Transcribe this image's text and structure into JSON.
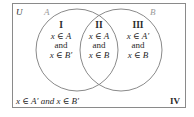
{
  "diagram": {
    "universe_label": "U",
    "set_a_label": "A",
    "set_b_label": "B",
    "colors": {
      "frame": "#8a8a8a",
      "circle": "#8a8a8a",
      "set_label": "#9a9a9a",
      "text": "#2a2a2a"
    },
    "regions": [
      {
        "numeral": "I",
        "line1": "x ∈ A",
        "line2": "and",
        "line3": "x ∈ B′"
      },
      {
        "numeral": "II",
        "line1": "x ∈ A",
        "line2": "and",
        "line3": "x ∈ B"
      },
      {
        "numeral": "III",
        "line1": "x ∈ A′",
        "line2": "and",
        "line3": "x ∈ B"
      }
    ],
    "outside": {
      "numeral": "IV",
      "text": "x ∈ A′ and x ∈ B′"
    }
  }
}
